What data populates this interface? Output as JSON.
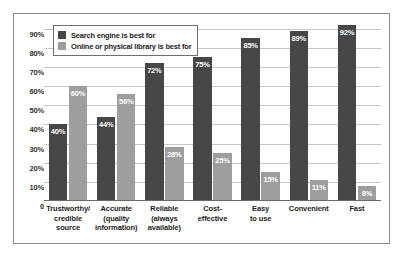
{
  "chart_data": {
    "type": "bar",
    "title": "",
    "subtitle": "",
    "xlabel": "",
    "ylabel": "",
    "grid": true,
    "legend_position": "top-left",
    "ylim": [
      0,
      95
    ],
    "ytick_labels": [
      "90%",
      "80%",
      "70%",
      "60%",
      "50%",
      "40%",
      "30%",
      "20%",
      "10%",
      "0"
    ],
    "ytick_values": [
      90,
      80,
      70,
      60,
      50,
      40,
      30,
      20,
      10,
      0
    ],
    "categories": [
      "Trustworthy/\ncredible\nsource",
      "Accurate\n(quality\ninformation)",
      "Reliable\n(always\navailable)",
      "Cost-\neffective",
      "Easy\nto use",
      "Convenient",
      "Fast"
    ],
    "series": [
      {
        "name": "Search engine is best for",
        "color": "#474747",
        "values": [
          40,
          44,
          72,
          75,
          85,
          89,
          92
        ],
        "labels": [
          "40%",
          "44%",
          "72%",
          "75%",
          "85%",
          "89%",
          "92%"
        ]
      },
      {
        "name": "Online or physical library is best for",
        "color": "#9e9e9e",
        "values": [
          60,
          56,
          28,
          25,
          15,
          11,
          8
        ],
        "labels": [
          "60%",
          "56%",
          "28%",
          "25%",
          "15%",
          "11%",
          "8%"
        ]
      }
    ]
  },
  "legend": {
    "items": [
      {
        "label": "Search engine is best for",
        "swatch": "dark"
      },
      {
        "label": "Online or physical library is best for",
        "swatch": "light"
      }
    ]
  }
}
